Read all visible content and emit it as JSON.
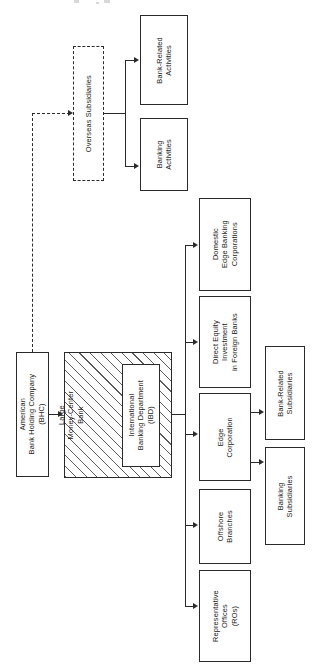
{
  "figure": {
    "orientation": "rotated-90-ccw",
    "kind": "organization-flow-chart",
    "ink_color": "#2a2a2a",
    "background": "#ffffff"
  },
  "nodes": {
    "bhc": {
      "label": "American\nBank Holding Company\n(BHC)",
      "style": "solid"
    },
    "mcb": {
      "label": "Large\nMoney-Center\nBank",
      "style": "hatched"
    },
    "ibd": {
      "label": "International\nBanking Department\n(IBD)",
      "style": "solid"
    },
    "overseas": {
      "label": "Overseas Subsidiaries",
      "style": "dashed"
    },
    "bank_rel_act": {
      "label": "Bank-Related\nActivities",
      "style": "solid"
    },
    "banking_act": {
      "label": "Banking\nActivities",
      "style": "solid"
    },
    "dom_edge": {
      "label": "Domestic\nEdge Banking\nCorporations",
      "style": "solid"
    },
    "direct_eq": {
      "label": "Direct Equity\nInvestment\nin Foreign Banks",
      "style": "solid"
    },
    "edge_corp": {
      "label": "Edge\nCorporation",
      "style": "solid"
    },
    "offshore": {
      "label": "Offshore\nBranches",
      "style": "solid"
    },
    "rep_off": {
      "label": "Representative\nOffices\n(ROs)",
      "style": "solid"
    },
    "bank_rel_sub": {
      "label": "Bank-Related\nSubsidiaries",
      "style": "solid"
    },
    "banking_sub": {
      "label": "Banking\nSubsidiaries",
      "style": "solid"
    }
  },
  "connections": [
    {
      "from": "bhc",
      "to": "mcb",
      "type": "solid",
      "arrow": "right"
    },
    {
      "from": "bhc",
      "to": "overseas",
      "type": "dashed",
      "arrow": "right"
    },
    {
      "from": "overseas",
      "to": "bank_rel_act",
      "type": "solid",
      "arrow": "right"
    },
    {
      "from": "overseas",
      "to": "banking_act",
      "type": "solid",
      "arrow": "right"
    },
    {
      "from": "ibd",
      "to": "dom_edge",
      "type": "solid",
      "arrow": "right"
    },
    {
      "from": "ibd",
      "to": "direct_eq",
      "type": "solid",
      "arrow": "right"
    },
    {
      "from": "ibd",
      "to": "edge_corp",
      "type": "solid",
      "arrow": "right"
    },
    {
      "from": "ibd",
      "to": "offshore",
      "type": "solid",
      "arrow": "right"
    },
    {
      "from": "ibd",
      "to": "rep_off",
      "type": "solid",
      "arrow": "right"
    },
    {
      "from": "edge_corp",
      "to": "bank_rel_sub",
      "type": "solid",
      "arrow": "right"
    },
    {
      "from": "edge_corp",
      "to": "banking_sub",
      "type": "solid",
      "arrow": "right"
    }
  ]
}
